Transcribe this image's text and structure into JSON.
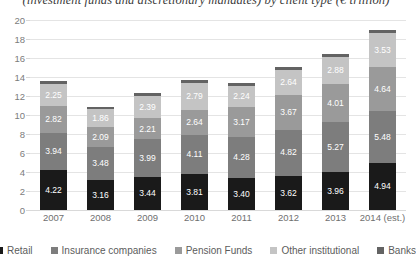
{
  "chart_data": {
    "type": "bar",
    "subtype": "stacked-bar",
    "title": "(investment funds and discretionary mandates) by client type (€ trillion)",
    "xlabel": "",
    "ylabel": "",
    "ylim": [
      0,
      20
    ],
    "ytick_step": 2,
    "yticks": [
      "20",
      "18",
      "16",
      "14",
      "12",
      "10",
      "8",
      "6",
      "4",
      "2",
      "0"
    ],
    "grid": true,
    "legend_position": "bottom",
    "categories": [
      "2007",
      "2008",
      "2009",
      "2010",
      "2011",
      "2012",
      "2013",
      "2014 (est.)"
    ],
    "series": [
      {
        "name": "Retail",
        "color": "#1a1a1a",
        "labelled": true,
        "values": [
          4.22,
          3.16,
          3.44,
          3.81,
          3.4,
          3.62,
          3.96,
          4.94
        ]
      },
      {
        "name": "Insurance companies",
        "color": "#7d7d7d",
        "labelled": true,
        "values": [
          3.94,
          3.48,
          3.99,
          4.11,
          4.28,
          4.82,
          5.27,
          5.48
        ]
      },
      {
        "name": "Pension Funds",
        "color": "#9a9a9a",
        "labelled": true,
        "values": [
          2.82,
          2.09,
          2.21,
          2.64,
          3.17,
          3.67,
          4.01,
          4.64
        ]
      },
      {
        "name": "Other institutional",
        "color": "#c4c4c4",
        "labelled": true,
        "values": [
          2.25,
          1.86,
          2.39,
          2.79,
          2.24,
          2.64,
          2.88,
          3.53
        ]
      },
      {
        "name": "Banks",
        "color": "#636363",
        "labelled": false,
        "values": [
          0.32,
          0.22,
          0.26,
          0.3,
          0.24,
          0.28,
          0.3,
          0.36
        ]
      }
    ],
    "totals": [
      13.55,
      10.81,
      12.29,
      13.65,
      13.33,
      15.03,
      16.42,
      19.95
    ]
  }
}
